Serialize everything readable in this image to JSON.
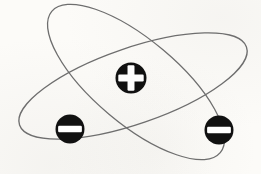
{
  "diagram": {
    "canvas": {
      "width": 261,
      "height": 174
    },
    "colors": {
      "background": "#fcfbf8",
      "orbit_stroke": "#6e6e6e",
      "particle_fill": "#111111",
      "symbol_fill": "#ffffff"
    },
    "orbit_stroke_width": 1.3,
    "orbits": [
      {
        "name": "orbit-shallow",
        "cx": 133,
        "cy": 86,
        "rx": 120,
        "ry": 38,
        "rotate": -19
      },
      {
        "name": "orbit-steep",
        "cx": 136,
        "cy": 82,
        "rx": 110,
        "ry": 42,
        "rotate": 40
      }
    ],
    "particles": [
      {
        "name": "nucleus",
        "sign": "plus",
        "cx": 131,
        "cy": 78,
        "r": 15.5
      },
      {
        "name": "electron-left",
        "sign": "minus",
        "cx": 70,
        "cy": 129,
        "r": 14.5
      },
      {
        "name": "electron-right",
        "sign": "minus",
        "cx": 219,
        "cy": 130,
        "r": 14.5
      }
    ],
    "symbol_metrics": {
      "bar_length_ratio": 1.64,
      "bar_thickness_ratio": 0.45,
      "bar_corner_radius": 1.2
    }
  }
}
